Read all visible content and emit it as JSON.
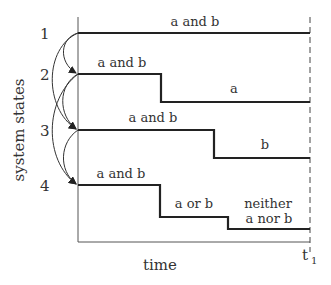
{
  "diagram": {
    "y_axis_label": "system states",
    "x_axis_label": "time",
    "end_time_label": "t",
    "end_time_subscript": "1",
    "states": [
      {
        "number": "1",
        "segments": [
          "a and b"
        ]
      },
      {
        "number": "2",
        "segments": [
          "a and b",
          "a"
        ]
      },
      {
        "number": "3",
        "segments": [
          "a and b",
          "b"
        ]
      },
      {
        "number": "4",
        "segments": [
          "a and b",
          "a or b",
          "neither",
          "a nor b"
        ]
      }
    ],
    "transitions": [
      {
        "from": "1",
        "to": "2"
      },
      {
        "from": "1",
        "to": "3"
      },
      {
        "from": "2",
        "to": "3"
      },
      {
        "from": "2",
        "to": "4"
      },
      {
        "from": "3",
        "to": "4"
      }
    ]
  }
}
